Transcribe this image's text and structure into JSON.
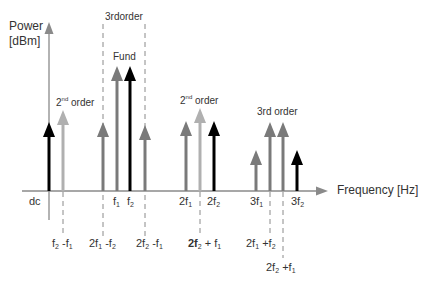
{
  "diagram": {
    "y_axis": {
      "label_line1": "Power",
      "label_line2": "[dBm]"
    },
    "x_axis": {
      "label": "Frequency [Hz]"
    },
    "group_labels": {
      "third_order_top": "3rdorder",
      "fund": "Fund",
      "second_order_left": {
        "base": "2",
        "sup": "nd",
        "rest": " order"
      },
      "second_order_mid": {
        "base": "2",
        "sup": "nd",
        "rest": " order"
      },
      "third_order_right": "3rd order"
    },
    "axis_labels": [
      {
        "id": "dc",
        "text": "dc"
      },
      {
        "id": "f1",
        "base": "f",
        "sub": "1"
      },
      {
        "id": "f2",
        "base": "f",
        "sub": "2"
      },
      {
        "id": "2f1",
        "base": "2f",
        "sub": "1"
      },
      {
        "id": "2f2",
        "base": "2f",
        "sub": "2"
      },
      {
        "id": "3f1",
        "base": "3f",
        "sub": "1"
      },
      {
        "id": "3f2",
        "base": "3f",
        "sub": "2"
      }
    ],
    "below_labels": [
      {
        "id": "f2-f1",
        "a": "f",
        "a_sub": "2",
        "mid": " -f",
        "b_sub": "1"
      },
      {
        "id": "2f1-f2",
        "a": "2f",
        "a_sub": "1",
        "mid": " -f",
        "b_sub": "2"
      },
      {
        "id": "2f2-f1",
        "a": "2f",
        "a_sub": "2",
        "mid": " -f",
        "b_sub": "1"
      },
      {
        "id": "2f2+f1",
        "a": "2f",
        "a_sub": "2",
        "mid": " + f",
        "b_sub": "1"
      },
      {
        "id": "2f1+f2",
        "a": "2f",
        "a_sub": "1",
        "mid": " +f",
        "b_sub": "2"
      },
      {
        "id": "2f2+f1-b",
        "a": "2f",
        "a_sub": "2",
        "mid": " +f",
        "b_sub": "1"
      }
    ],
    "colors": {
      "black": "#000000",
      "dark_gray": "#7a7a7a",
      "light_gray": "#b0b0b0",
      "axis": "#8a8a8a",
      "dash": "#8a8a8a"
    },
    "arrows": [
      {
        "x": 49,
        "top": 122,
        "color": "black"
      },
      {
        "x": 63,
        "top": 110,
        "color": "light_gray"
      },
      {
        "x": 103,
        "top": 122,
        "color": "dark_gray"
      },
      {
        "x": 117,
        "top": 66,
        "color": "dark_gray"
      },
      {
        "x": 130,
        "top": 66,
        "color": "black"
      },
      {
        "x": 145,
        "top": 125,
        "color": "dark_gray"
      },
      {
        "x": 186,
        "top": 121,
        "color": "dark_gray"
      },
      {
        "x": 200,
        "top": 108,
        "color": "light_gray"
      },
      {
        "x": 214,
        "top": 121,
        "color": "black"
      },
      {
        "x": 256,
        "top": 150,
        "color": "dark_gray"
      },
      {
        "x": 270,
        "top": 122,
        "color": "dark_gray"
      },
      {
        "x": 283,
        "top": 122,
        "color": "dark_gray"
      },
      {
        "x": 297,
        "top": 150,
        "color": "black"
      }
    ]
  }
}
